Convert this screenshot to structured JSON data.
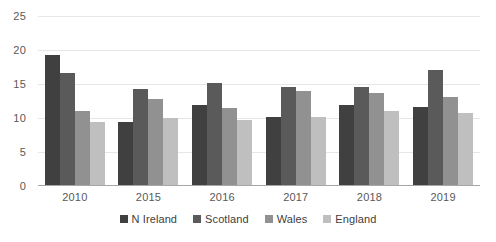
{
  "chart_data": {
    "type": "bar",
    "title": "",
    "subtitle": "",
    "xlabel": "",
    "ylabel": "",
    "categories": [
      "2010",
      "2015",
      "2016",
      "2017",
      "2018",
      "2019"
    ],
    "series": [
      {
        "name": "N Ireland",
        "color": "#404040",
        "values": [
          19.3,
          9.4,
          11.9,
          10.2,
          11.9,
          11.6
        ]
      },
      {
        "name": "Scotland",
        "color": "#5a5a5a",
        "values": [
          16.6,
          14.2,
          15.2,
          14.5,
          14.5,
          17.0
        ]
      },
      {
        "name": "Wales",
        "color": "#919191",
        "values": [
          11.1,
          12.8,
          11.5,
          14.0,
          13.7,
          13.1
        ]
      },
      {
        "name": "England",
        "color": "#bfbfbf",
        "values": [
          9.4,
          10.0,
          9.7,
          10.1,
          11.0,
          10.7
        ]
      }
    ],
    "ylim": [
      0,
      25
    ],
    "yticks": [
      0,
      5,
      10,
      15,
      20,
      25
    ],
    "ytick_labels": [
      "0",
      "5",
      "10",
      "15",
      "20",
      "25"
    ],
    "grid": true,
    "legend_position": "bottom",
    "annotations": []
  }
}
